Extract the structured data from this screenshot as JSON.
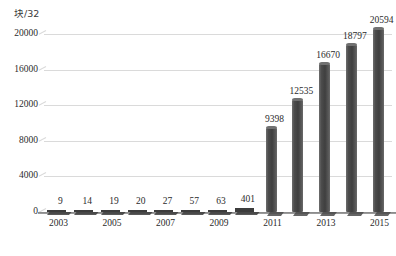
{
  "chart_data": {
    "type": "bar",
    "title": "",
    "subtitle": "",
    "xlabel": "",
    "ylabel": "块/32",
    "ylim": [
      0,
      20000
    ],
    "ytick_labels": [
      "0",
      "4000",
      "8000",
      "12000",
      "16000",
      "20000"
    ],
    "ytick_values": [
      0,
      4000,
      8000,
      12000,
      16000,
      20000
    ],
    "grid": true,
    "legend": false,
    "legend_position": "none",
    "categories": [
      "2003",
      "2004",
      "2005",
      "2006",
      "2007",
      "2008",
      "2009",
      "2010",
      "2011",
      "2012",
      "2013",
      "2014",
      "2015"
    ],
    "xtick_labels": [
      "2003",
      "",
      "2005",
      "",
      "2007",
      "",
      "2009",
      "",
      "2011",
      "",
      "2013",
      "",
      "2015"
    ],
    "values": [
      9,
      14,
      19,
      20,
      27,
      57,
      63,
      401,
      9398,
      12535,
      16670,
      18797,
      20594
    ],
    "data_labels": [
      "9",
      "14",
      "19",
      "20",
      "27",
      "57",
      "63",
      "401",
      "9398",
      "12535",
      "16670",
      "18797",
      "20594"
    ],
    "series": [
      {
        "name": "",
        "values": [
          9,
          14,
          19,
          20,
          27,
          57,
          63,
          401,
          9398,
          12535,
          16670,
          18797,
          20594
        ]
      }
    ],
    "bar_color": "#4c4c4c",
    "gridline_color": "#dadada",
    "axis_color": "#8c8c8c",
    "text_color": "#2b2b2b"
  }
}
